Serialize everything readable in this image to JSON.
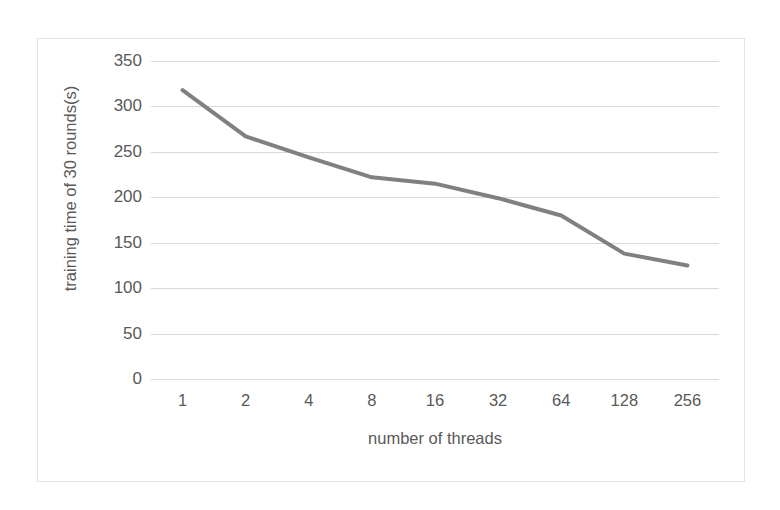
{
  "chart_data": {
    "type": "line",
    "title": "",
    "subtitle": "",
    "xlabel": "number of threads",
    "ylabel": "training time of 30 rounds(s)",
    "categories": [
      "1",
      "2",
      "4",
      "8",
      "16",
      "32",
      "64",
      "128",
      "256"
    ],
    "values": [
      318,
      267,
      244,
      222,
      215,
      199,
      180,
      138,
      125
    ],
    "series": [
      {
        "name": "training time of 30 rounds(s)",
        "values": [
          318,
          267,
          244,
          222,
          215,
          199,
          180,
          138,
          125
        ]
      }
    ],
    "ylim": [
      0,
      350
    ],
    "yticks": [
      0,
      50,
      100,
      150,
      200,
      250,
      300,
      350
    ],
    "ytick_labels": [
      "0",
      "50",
      "100",
      "150",
      "200",
      "250",
      "300",
      "350"
    ],
    "grid": "horizontal",
    "legend": "none",
    "line_color": "#808080",
    "gridline_color": "#D9D9D9",
    "text_color": "#595959",
    "border_color": "#E3E3E3",
    "background_color": "#FFFFFF",
    "line_width": 4,
    "markers": false
  }
}
